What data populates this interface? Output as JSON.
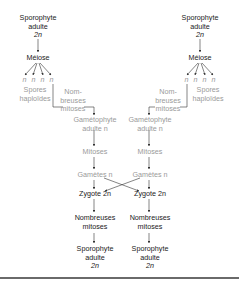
{
  "diagram": {
    "colors": {
      "diploid_text": "#1a1a1a",
      "haploid_text": "#9a9a9a",
      "arrow": "#333333",
      "rule": "#6a6a6a"
    },
    "left": {
      "sporophyte_top": [
        "Sporophyte",
        "adulte",
        "2n"
      ],
      "meiose": "Méiose",
      "spores_n": [
        "n",
        "n",
        "n",
        "n"
      ],
      "spores_label": [
        "Spores",
        "haploïdes"
      ],
      "mitoses_label": [
        "Nom-",
        "breuses",
        "mitoses"
      ],
      "gametophyte": [
        "Gamétophyte",
        "adulte n"
      ],
      "mitoses": "Mitoses",
      "gametes": "Gamètes n",
      "zygote": "Zygote 2n",
      "nombreuses_mitoses": [
        "Nombreuses",
        "mitoses"
      ],
      "sporophyte_bottom": [
        "Sporophyte",
        "adulte",
        "2n"
      ]
    },
    "right": {
      "sporophyte_top": [
        "Sporophyte",
        "adulte",
        "2n"
      ],
      "meiose": "Méiose",
      "spores_n": [
        "n",
        "n",
        "n",
        "n"
      ],
      "spores_label": [
        "Spores",
        "haploïdes"
      ],
      "mitoses_label": [
        "Nom-",
        "breuses",
        "mitoses"
      ],
      "gametophyte": [
        "Gamétophyte",
        "adulte n"
      ],
      "mitoses": "Mitoses",
      "gametes": "Gamètes n",
      "zygote": "Zygote 2n",
      "nombreuses_mitoses": [
        "Nombreuses",
        "mitoses"
      ],
      "sporophyte_bottom": [
        "Sporophyte",
        "adulte",
        "2n"
      ]
    }
  }
}
